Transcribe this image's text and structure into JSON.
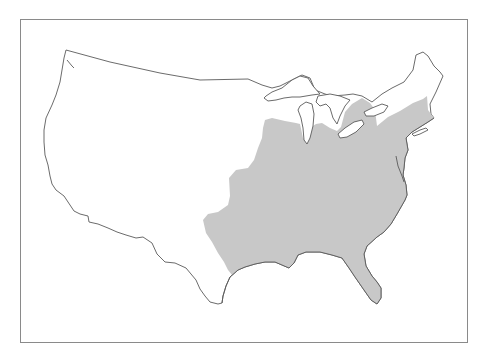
{
  "map": {
    "type": "range-map",
    "region": "Contiguous United States",
    "shaded_region": "Eastern United States",
    "colors": {
      "frame_border": "#8a8a8a",
      "outline": "#5a5a5a",
      "shaded_fill": "#c8c8c8",
      "land_fill": "#ffffff",
      "background": "#ffffff"
    }
  }
}
